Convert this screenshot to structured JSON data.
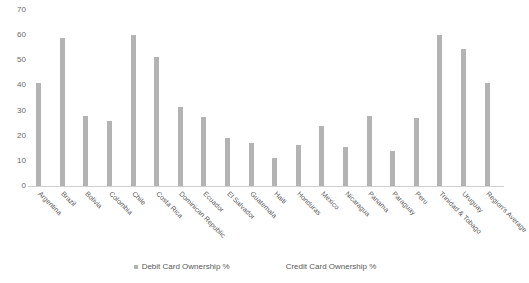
{
  "chart_data": {
    "type": "bar",
    "title": "",
    "xlabel": "",
    "ylabel": "",
    "ylim": [
      0,
      70
    ],
    "ytick_step": 10,
    "yticks": [
      70,
      60,
      50,
      40,
      30,
      20,
      10,
      0
    ],
    "grid": false,
    "legend_position": "bottom",
    "categories": [
      "Argentina",
      "Brazil",
      "Bolivia",
      "Colombia",
      "Chile",
      "Costa Rica",
      "Dominican Republic",
      "Ecuador",
      "El Salvador",
      "Guatemala",
      "Haiti",
      "Honduras",
      "Mexico",
      "Nicaragua",
      "Panama",
      "Paraguay",
      "Peru",
      "Trinidad & Tobago",
      "Uruguay",
      "Region's Average"
    ],
    "series": [
      {
        "name": "Debit Card Ownership %",
        "color": "#b3b3b3",
        "values": [
          41,
          59,
          28,
          26,
          60,
          51.5,
          31.5,
          27.5,
          19,
          17,
          11,
          16.5,
          24,
          15.5,
          28,
          14,
          27,
          60,
          54.5,
          41
        ]
      },
      {
        "name": "Credit Card Ownership %",
        "color": "#ffffff",
        "values": [
          0,
          0,
          0,
          0,
          0,
          0,
          0,
          0,
          0,
          0,
          0,
          0,
          0,
          0,
          0,
          0,
          0,
          0,
          0,
          0
        ]
      }
    ]
  },
  "legend": {
    "items": [
      {
        "label": "Debit Card Ownership %"
      },
      {
        "label": "Credit Card Ownership %"
      }
    ]
  }
}
